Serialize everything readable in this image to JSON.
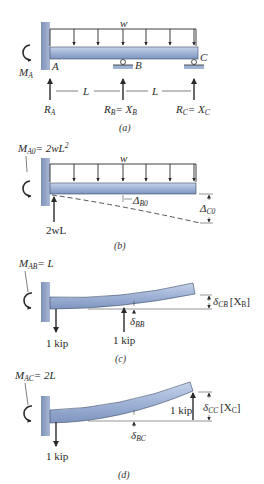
{
  "figure": {
    "a": {
      "caption": "(a)",
      "load": "w",
      "moment": "M",
      "moment_sub": "A",
      "point_a": "A",
      "point_b": "B",
      "point_c": "C",
      "span1": "L",
      "span2": "L",
      "ra": "R",
      "ra_sub": "A",
      "rb": "R",
      "rb_sub": "B",
      "rb_eq": "= X",
      "rb_eq_sub": "B",
      "rc": "R",
      "rc_sub": "C",
      "rc_eq": "= X",
      "rc_eq_sub": "C"
    },
    "b": {
      "caption": "(b)",
      "moment": "M",
      "moment_sub": "A0",
      "moment_eq": "= 2wL",
      "moment_exp": "2",
      "load": "w",
      "reaction": "2wL",
      "delta_b": "Δ",
      "delta_b_sub": "B0",
      "delta_c": "Δ",
      "delta_c_sub": "C0"
    },
    "c": {
      "caption": "(c)",
      "moment": "M",
      "moment_sub": "AB",
      "moment_eq": "= L",
      "reaction": "1 kip",
      "load": "1 kip",
      "delta_bb": "δ",
      "delta_bb_sub": "BB",
      "delta_cb": "δ",
      "delta_cb_sub": "CB",
      "bracket": "[X",
      "bracket_sub": "B",
      "bracket_end": "]"
    },
    "d": {
      "caption": "(d)",
      "moment": "M",
      "moment_sub": "AC",
      "moment_eq": "= 2L",
      "reaction": "1 kip",
      "load": "1 kip",
      "delta_bc": "δ",
      "delta_bc_sub": "BC",
      "delta_cc": "δ",
      "delta_cc_sub": "CC",
      "bracket": "[X",
      "bracket_sub": "C",
      "bracket_end": "]"
    }
  },
  "colors": {
    "beam": "#9fb3d6",
    "beam_edge": "#3a4a66",
    "wall": "#8fa0c2",
    "ink": "#2a2a2a"
  }
}
